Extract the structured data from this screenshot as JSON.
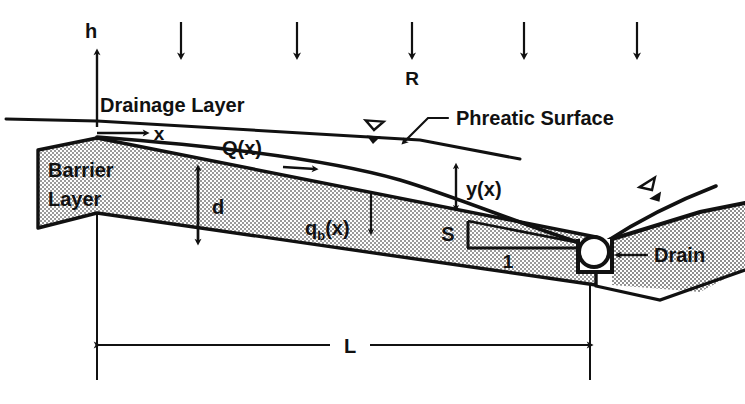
{
  "figure": {
    "colors": {
      "ink": "#111111",
      "fill_stipple_light": "#d9d9d9",
      "background": "#ffffff"
    }
  },
  "labels": {
    "h_axis": "h",
    "x_axis": "x",
    "recharge": "R",
    "drainage_layer": "Drainage Layer",
    "phreatic_surface": "Phreatic Surface",
    "barrier_layer_line1": "Barrier",
    "barrier_layer_line2": "Layer",
    "flow_rate": "Q(x)",
    "thickness": "d",
    "base_leakage_main": "q",
    "base_leakage_sub": "b",
    "base_leakage_tail": "(x)",
    "head": "y(x)",
    "slope_rise": "S",
    "slope_run": "1",
    "drain": "Drain",
    "length": "L"
  },
  "icons": {
    "water_table_left": "water-table-symbol",
    "water_table_right": "water-table-symbol",
    "drain_pipe": "drain-pipe-circle",
    "recharge_arrows": "downward-arrow"
  },
  "recharge_arrows": {
    "count": 6,
    "x_positions": [
      181,
      297,
      412,
      524,
      637,
      704
    ],
    "y_top": 22,
    "y_bottom": 62
  },
  "dimensions": {
    "L_line_y": 345,
    "L_x_start": 97,
    "L_x_end": 590,
    "d_x": 198,
    "d_y_top": 166,
    "d_y_bottom": 242,
    "y_of_x_x": 456,
    "y_of_x_top": 165,
    "y_of_x_bottom": 208
  }
}
